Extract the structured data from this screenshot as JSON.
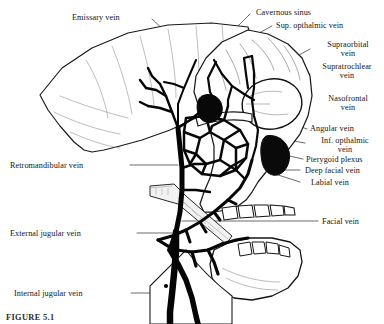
{
  "figure": {
    "caption": "FIGURE 5.1",
    "ink_color": "#000000",
    "background_color": "#ffffff"
  },
  "labels": {
    "emissary_vein": "Emissary vein",
    "cavernous_sinus": "Cavernous sinus",
    "sup_opthalmic_vein": "Sup. opthalmic vein",
    "supraorbital_vein": "Supraorbital\nvein",
    "supratrochlear_vein": "Supratrochlear\nvein",
    "nasofrontal_vein": "Nasofrontal\nvein",
    "angular_vein": "Angular vein",
    "inf_opthalmic_vein": "Inf. opthalmic\nvein",
    "pterygoid_plexus": "Pterygoid plexus",
    "deep_facial_vein": "Deep facial vein",
    "labial_vein": "Labial vein",
    "facial_vein": "Facial vein",
    "retromandibular_vein": "Retromandibular vein",
    "external_jugular_vein": "External jugular vein",
    "internal_jugular_vein": "Internal jugular vein"
  }
}
